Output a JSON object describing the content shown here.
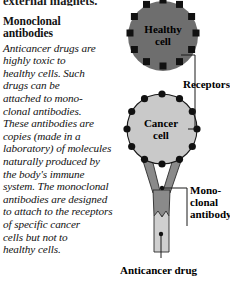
{
  "page": {
    "clipped_previous_line": "external magnets.",
    "heading_lines": [
      "Monoclonal",
      "antibodies"
    ],
    "body_lines": [
      "Anticancer drugs are",
      "highly toxic to",
      "healthy cells. Such",
      "drugs can be",
      "attached to mono-",
      "clonal antibodies.",
      "These antibodies are",
      "copies (made in a",
      "laboratory) of molecules",
      "naturally produced by",
      "the body's immune",
      "system. The monoclonal",
      "antibodies are designed",
      "to attach to the receptors",
      "of specific cancer",
      "cells but not to",
      "healthy cells."
    ]
  },
  "diagram": {
    "healthy_cell": {
      "label_lines": [
        "Healthy",
        "cell"
      ],
      "fill": "#6e6e6e",
      "receptor_count": 12
    },
    "cancer_cell": {
      "label_lines": [
        "Cancer",
        "cell"
      ],
      "fill": "#c9c9c9",
      "receptor_count": 12
    },
    "receptor_color": "#111111",
    "callouts": {
      "receptors": "Receptors",
      "monoclonal_antibody_lines": [
        "Mono-",
        "clonal",
        "antibody"
      ],
      "anticancer_drug": "Anticancer drug"
    },
    "antibody": {
      "fill": "#8a8a8a"
    },
    "drug": {
      "fill": "#cfcfcf"
    }
  }
}
